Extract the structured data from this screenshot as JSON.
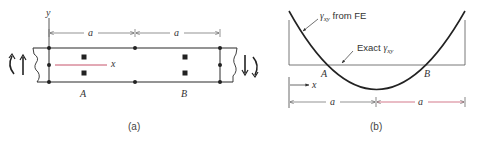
{
  "panel_a": {
    "caption": "(a)",
    "axis_y_label": "y",
    "axis_x_label": "x",
    "dim_labels": [
      "a",
      "a"
    ],
    "point_labels": [
      "A",
      "B"
    ]
  },
  "panel_b": {
    "caption": "(b)",
    "annotation_fe": {
      "gamma": "γ",
      "sub": "xy",
      "suffix": " from FE"
    },
    "annotation_exact": {
      "prefix": "Exact ",
      "gamma": "γ",
      "sub": "xy"
    },
    "point_labels": [
      "A",
      "B"
    ],
    "axis_x_label": "x",
    "dim_labels": [
      "a",
      "a"
    ]
  },
  "colors": {
    "line": "#2a2a2a",
    "accent_red": "#c0405a",
    "dim": "#555555"
  }
}
